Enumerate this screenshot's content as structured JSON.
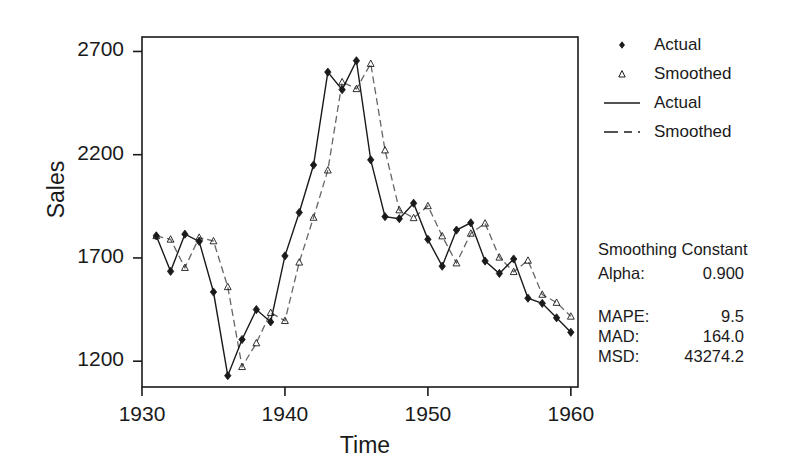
{
  "chart_data": {
    "type": "line",
    "title": "",
    "xlabel": "Time",
    "ylabel": "Sales",
    "xlim": [
      1930.0,
      1960.5
    ],
    "ylim": [
      1075,
      2770
    ],
    "xticks": [
      1930,
      1940,
      1950,
      1960
    ],
    "yticks": [
      1200,
      1700,
      2200,
      2700
    ],
    "grid": false,
    "legend_position": "right",
    "markers": {
      "actual": "filled-diamond",
      "smoothed": "open-triangle"
    },
    "x": [
      1931,
      1932,
      1933,
      1934,
      1935,
      1936,
      1937,
      1938,
      1939,
      1940,
      1941,
      1942,
      1943,
      1944,
      1945,
      1946,
      1947,
      1948,
      1949,
      1950,
      1951,
      1952,
      1953,
      1954,
      1955,
      1956,
      1957,
      1958,
      1959,
      1960
    ],
    "series": [
      {
        "name": "Actual",
        "style": "solid",
        "values": [
          1807,
          1635,
          1815,
          1780,
          1535,
          1130,
          1305,
          1450,
          1390,
          1710,
          1920,
          2150,
          2600,
          2515,
          2655,
          2175,
          1900,
          1890,
          1965,
          1790,
          1660,
          1835,
          1870,
          1685,
          1625,
          1695,
          1505,
          1480,
          1410,
          1340
        ],
        "legend_label": "Actual"
      },
      {
        "name": "Smoothed",
        "style": "dashed",
        "values": [
          1807,
          1790,
          1653,
          1799,
          1782,
          1560,
          1173,
          1288,
          1435,
          1396,
          1679,
          1896,
          2125,
          2552,
          2519,
          2641,
          2222,
          1932,
          1894,
          1952,
          1806,
          1675,
          1819,
          1868,
          1703,
          1633,
          1688,
          1523,
          1484,
          1417
        ],
        "legend_label": "Smoothed"
      }
    ],
    "legend_entries": [
      {
        "label": "Actual",
        "kind": "marker",
        "marker": "filled-diamond"
      },
      {
        "label": "Smoothed",
        "kind": "marker",
        "marker": "open-triangle"
      },
      {
        "label": "Actual",
        "kind": "line",
        "style": "solid"
      },
      {
        "label": "Smoothed",
        "kind": "line",
        "style": "dashed"
      }
    ],
    "annotations": {
      "smoothing_constant_title": "Smoothing Constant",
      "alpha_label": "Alpha:",
      "alpha_value": "0.900",
      "mape_label": "MAPE:",
      "mape_value": "9.5",
      "mad_label": "MAD:",
      "mad_value": "164.0",
      "msd_label": "MSD:",
      "msd_value": "43274.2"
    },
    "colors": {
      "axis": "#1a1a1a",
      "actual": "#1a1a1a",
      "smoothed": "#555555",
      "background": "#ffffff"
    }
  }
}
